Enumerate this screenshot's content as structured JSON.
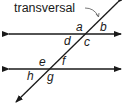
{
  "diagram": {
    "title_label": "transversal",
    "angle_labels": {
      "a": "a",
      "b": "b",
      "c": "c",
      "d": "d",
      "e": "e",
      "f": "f",
      "g": "g",
      "h": "h"
    },
    "lines": [
      {
        "name": "parallel-line-1",
        "type": "double-arrow"
      },
      {
        "name": "parallel-line-2",
        "type": "double-arrow"
      },
      {
        "name": "transversal",
        "type": "double-arrow"
      }
    ],
    "colors": {
      "stroke": "#1a1a1a",
      "background": "#ffffff"
    }
  }
}
